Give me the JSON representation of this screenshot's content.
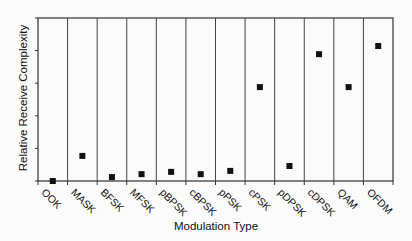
{
  "chart_data": {
    "type": "scatter",
    "title": "",
    "xlabel": "Modulation Type",
    "ylabel": "Relative Receive Complexity",
    "categories": [
      "OOK",
      "MASK",
      "BFSK",
      "MFSK",
      "pBPSK",
      "cBPSK",
      "pPSK",
      "cPSK",
      "pDPSK",
      "cDPSK",
      "QAM",
      "OFDM"
    ],
    "values": [
      0,
      0.77,
      0.12,
      0.21,
      0.28,
      0.21,
      0.31,
      2.88,
      0.46,
      3.89,
      2.88,
      4.14
    ],
    "ylim": [
      0,
      5
    ],
    "yticks_labeled": false,
    "grid": "vertical category separators",
    "legend": null,
    "marker": "square",
    "marker_color": "#111111"
  }
}
